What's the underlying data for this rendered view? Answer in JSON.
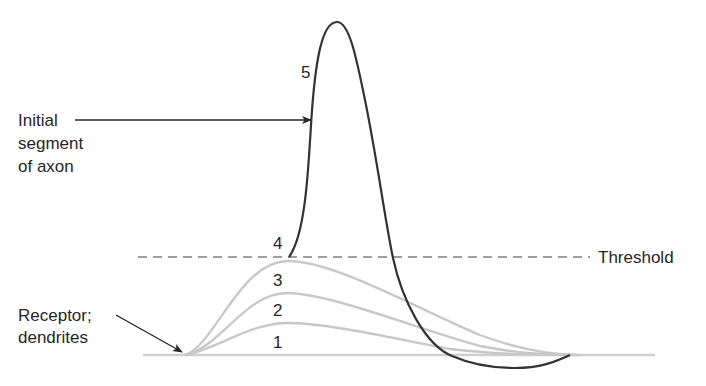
{
  "diagram": {
    "labels": {
      "initial_segment_line1": "Initial",
      "initial_segment_line2": "segment",
      "initial_segment_line3": "of axon",
      "receptor_line1": "Receptor;",
      "receptor_line2": "dendrites",
      "threshold": "Threshold"
    },
    "curve_numbers": [
      "1",
      "2",
      "3",
      "4",
      "5"
    ],
    "colors": {
      "action_potential": "#333333",
      "graded_potentials": "#c8c8c8",
      "baseline": "#c8c8c8",
      "threshold_line": "#9a9a9a",
      "text": "#262626"
    }
  }
}
